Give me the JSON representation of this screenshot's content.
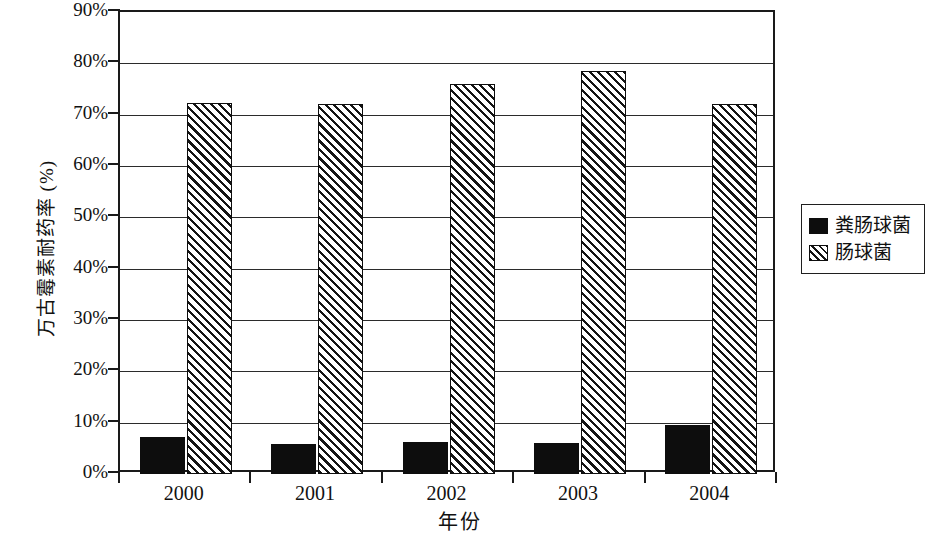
{
  "chart_data": {
    "type": "bar",
    "title": "",
    "xlabel": "年份",
    "ylabel": "万古霉素耐药率 (%)",
    "categories": [
      "2000",
      "2001",
      "2002",
      "2003",
      "2004"
    ],
    "series": [
      {
        "name": "粪肠球菌",
        "values": [
          7.3,
          5.8,
          6.3,
          6.0,
          9.5
        ],
        "fill": "solid",
        "color": "#0d0d0d"
      },
      {
        "name": "肠球菌",
        "values": [
          72.2,
          72.0,
          76.0,
          78.6,
          72.0
        ],
        "fill": "hatched",
        "color": "#141414"
      }
    ],
    "ylim": [
      0,
      90
    ],
    "ytick_values": [
      0,
      10,
      20,
      30,
      40,
      50,
      60,
      70,
      80,
      90
    ],
    "ytick_labels": [
      "0%",
      "10%",
      "20%",
      "30%",
      "40%",
      "50%",
      "60%",
      "70%",
      "80%",
      "90%"
    ],
    "grid": true,
    "grid_axis": "y",
    "legend_position": "right",
    "frame": true
  },
  "axes": {
    "y_title": "万古霉素耐药率 (%)",
    "x_title": "年份"
  },
  "legend": {
    "entries": [
      {
        "label": "粪肠球菌",
        "swatch": "solid"
      },
      {
        "label": "肠球菌",
        "swatch": "hatched"
      }
    ]
  }
}
